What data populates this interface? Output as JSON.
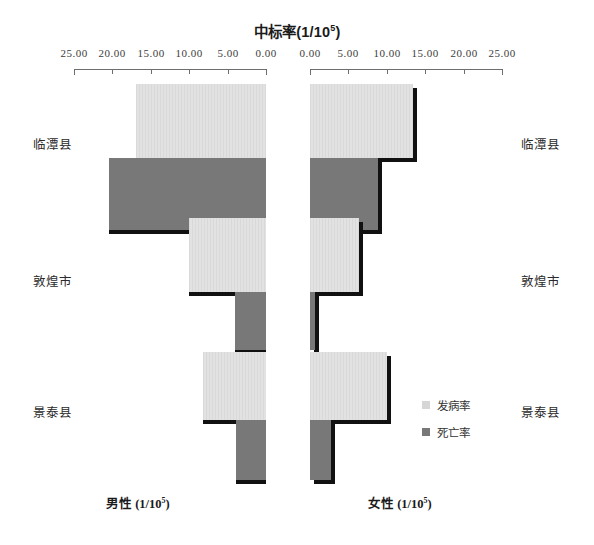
{
  "chart_data": {
    "type": "bar",
    "orientation": "horizontal-pyramid",
    "title": "中标率(1/10",
    "title_sup": "5",
    "title_suffix": ")",
    "categories": [
      "临潭县",
      "敦煌市",
      "景泰县"
    ],
    "left_panel_label": "男性  (1/10",
    "left_panel_sup": "5",
    "left_panel_suffix": ")",
    "right_panel_label": "女性  (1/10",
    "right_panel_sup": "5",
    "right_panel_suffix": ")",
    "xlabel": "",
    "ylabel": "",
    "grid": false,
    "legend_position": "bottom-right",
    "axis_max": 25,
    "axis_min": 0,
    "tick_step": 5,
    "left_ticks": [
      "25.00",
      "20.00",
      "15.00",
      "10.00",
      "5.00",
      "0.00"
    ],
    "right_ticks": [
      "0.00",
      "5.00",
      "10.00",
      "15.00",
      "20.00",
      "25.00"
    ],
    "legend": [
      {
        "name": "发病率",
        "color": "#dedede"
      },
      {
        "name": "死亡率",
        "color": "#787878"
      }
    ],
    "series": [
      {
        "name": "发病率",
        "panel": "男性",
        "values": [
          16.8,
          10.0,
          8.1
        ]
      },
      {
        "name": "死亡率",
        "panel": "男性",
        "values": [
          20.3,
          4.0,
          3.9
        ]
      },
      {
        "name": "发病率",
        "panel": "女性",
        "values": [
          13.4,
          6.3,
          10.0
        ]
      },
      {
        "name": "死亡率",
        "panel": "女性",
        "values": [
          8.8,
          0.7,
          2.7
        ]
      }
    ]
  },
  "colors": {
    "light_bar": "#dedede",
    "dark_bar": "#787878",
    "shadow": "#111111",
    "axis": "#6e6e6e",
    "text": "#1a1a1a"
  }
}
